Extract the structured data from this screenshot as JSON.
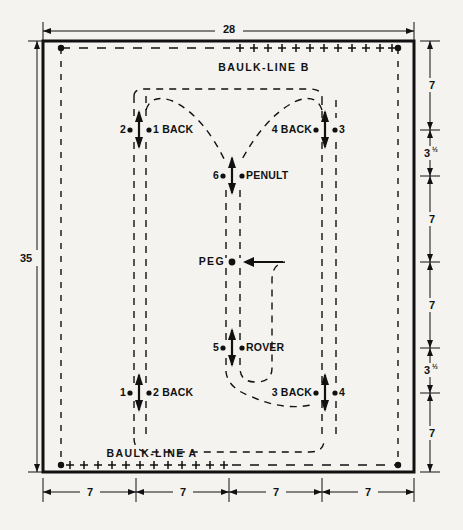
{
  "diagram": {
    "units_note": "yards",
    "colors": {
      "ink": "#111111",
      "paper": "#f4f3f0"
    },
    "court": {
      "width_label": "28",
      "height_label": "35",
      "border_name": "court-boundary"
    },
    "baulk_lines": [
      {
        "name": "baulk-line-b",
        "label": "BAULK-LINE B",
        "position": "top"
      },
      {
        "name": "baulk-line-a",
        "label": "BAULK-LINE A",
        "position": "bottom"
      }
    ],
    "peg": {
      "label": "PEG"
    },
    "hoops": [
      {
        "id": "h1",
        "left_label": "2",
        "right_label": "1 BACK",
        "x": 139,
        "y": 130
      },
      {
        "id": "h2",
        "left_label": "4 BACK",
        "right_label": "3",
        "x": 325,
        "y": 130
      },
      {
        "id": "h3",
        "left_label": "6",
        "right_label": "PENULT",
        "x": 232,
        "y": 176
      },
      {
        "id": "h4",
        "left_label": "5",
        "right_label": "ROVER",
        "x": 232,
        "y": 348
      },
      {
        "id": "h5",
        "left_label": "1",
        "right_label": "2 BACK",
        "x": 139,
        "y": 393
      },
      {
        "id": "h6",
        "left_label": "3 BACK",
        "right_label": "4",
        "x": 325,
        "y": 393
      }
    ],
    "dimensions": {
      "top": {
        "label": "28"
      },
      "left": {
        "label": "35"
      },
      "right_segments": [
        {
          "label": "7",
          "half": ""
        },
        {
          "label": "3",
          "half": "½"
        },
        {
          "label": "7",
          "half": ""
        },
        {
          "label": "7",
          "half": ""
        },
        {
          "label": "3",
          "half": "½"
        },
        {
          "label": "7",
          "half": ""
        }
      ],
      "bottom_segments": [
        {
          "label": "7"
        },
        {
          "label": "7"
        },
        {
          "label": "7"
        },
        {
          "label": "7"
        }
      ]
    }
  }
}
